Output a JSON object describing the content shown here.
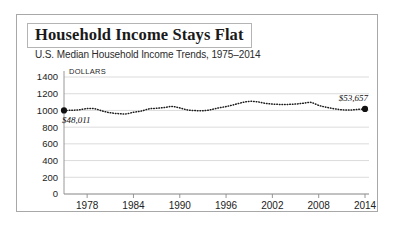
{
  "figure": {
    "title": "Household Income Stays Flat",
    "subtitle": "U.S. Median Household Income Trends, 1975–2014"
  },
  "chart_data": {
    "type": "line",
    "title": "Household Income Stays Flat",
    "subtitle": "U.S. Median Household Income Trends, 1975–2014",
    "xlabel": "",
    "ylabel": "DOLLARS",
    "ylim": [
      0,
      1400
    ],
    "xlim": [
      1975,
      2014
    ],
    "grid": true,
    "legend": "none",
    "line_style": "dotted",
    "y_ticks": [
      0,
      200,
      400,
      600,
      800,
      1000,
      1200,
      1400
    ],
    "x_ticks": [
      1978,
      1984,
      1990,
      1996,
      2002,
      2008,
      2014
    ],
    "annotations": [
      {
        "name": "start-value",
        "text": "$48,011",
        "x": 1975,
        "y": 1000
      },
      {
        "name": "end-value",
        "text": "$53,657",
        "x": 2014,
        "y": 1018
      }
    ],
    "markers": [
      {
        "x": 1975,
        "y": 1000
      },
      {
        "x": 2014,
        "y": 1018
      }
    ],
    "x": [
      1975,
      1976,
      1977,
      1978,
      1979,
      1980,
      1981,
      1982,
      1983,
      1984,
      1985,
      1986,
      1987,
      1988,
      1989,
      1990,
      1991,
      1992,
      1993,
      1994,
      1995,
      1996,
      1997,
      1998,
      1999,
      2000,
      2001,
      2002,
      2003,
      2004,
      2005,
      2006,
      2007,
      2008,
      2009,
      2010,
      2011,
      2012,
      2013,
      2014
    ],
    "values": [
      1000,
      1002,
      1008,
      1022,
      1020,
      992,
      972,
      962,
      958,
      978,
      992,
      1018,
      1026,
      1034,
      1048,
      1030,
      1006,
      998,
      996,
      1008,
      1030,
      1046,
      1068,
      1092,
      1108,
      1104,
      1086,
      1076,
      1072,
      1072,
      1076,
      1086,
      1096,
      1060,
      1038,
      1020,
      1008,
      1004,
      1012,
      1018
    ]
  }
}
